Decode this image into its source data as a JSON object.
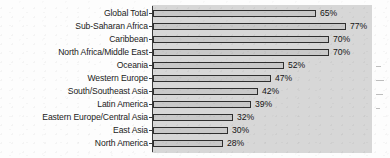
{
  "chart_data": {
    "type": "bar",
    "orientation": "horizontal",
    "title": "",
    "subtitle": "",
    "xlabel": "",
    "ylabel": "",
    "xlim": [
      0,
      80
    ],
    "grid": false,
    "legend": null,
    "value_suffix": "%",
    "categories": [
      "Global Total",
      "Sub-Saharan Africa",
      "Caribbean",
      "North Africa/Middle East",
      "Oceania",
      "Western Europe",
      "South/Southeast Asia",
      "Latin America",
      "Eastern Europe/Central Asia",
      "East Asia",
      "North America"
    ],
    "values": [
      65,
      77,
      70,
      70,
      52,
      47,
      42,
      39,
      32,
      30,
      28
    ],
    "data_labels": [
      "65%",
      "77%",
      "70%",
      "70%",
      "52%",
      "47%",
      "42%",
      "39%",
      "32%",
      "30%",
      "28%"
    ]
  },
  "style": {
    "panel_color": "#d7d7d7",
    "bar_fill": "#c9c9c9",
    "bar_outline": "#2f2f2f",
    "text_color": "#1b1b1b",
    "page_background": "#fdfdfd"
  }
}
